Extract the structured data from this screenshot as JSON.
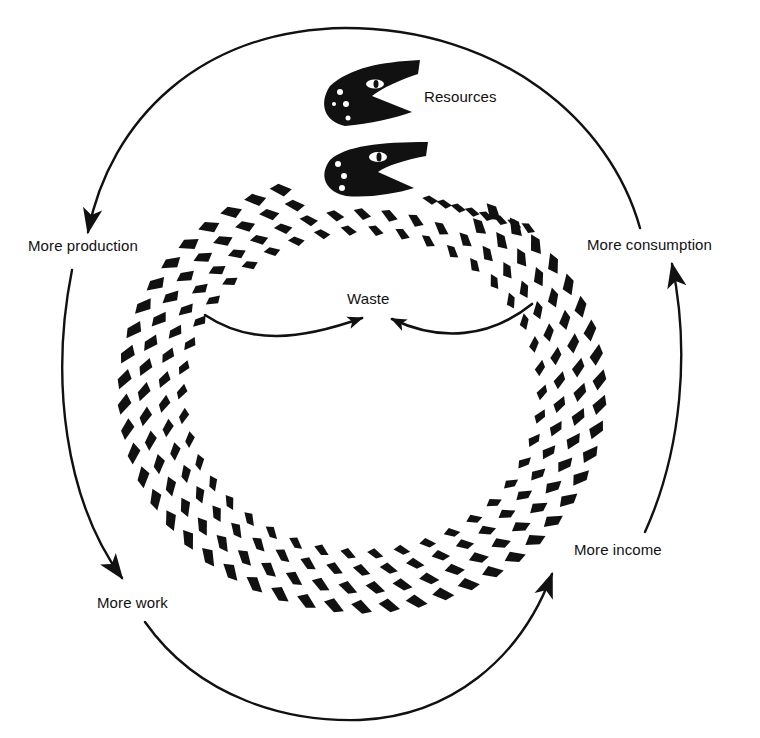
{
  "diagram": {
    "type": "cycle",
    "colors": {
      "ink": "#111111",
      "background": "#ffffff"
    },
    "labels": {
      "resources": "Resources",
      "more_production": "More production",
      "more_consumption": "More consumption",
      "waste": "Waste",
      "more_work": "More work",
      "more_income": "More income"
    },
    "cycle_order": [
      "Resources",
      "More production",
      "More work",
      "More income",
      "More consumption"
    ],
    "flows": [
      {
        "from": "Resources",
        "to": "More production",
        "arrow": "outer-top-arc"
      },
      {
        "from": "More production",
        "to": "More work",
        "arrow": "outer-left-arc"
      },
      {
        "from": "More work",
        "to": "More income",
        "arrow": "outer-bottom-arc"
      },
      {
        "from": "More income",
        "to": "More consumption",
        "arrow": "outer-right-arc"
      },
      {
        "from": "More production",
        "to": "Waste",
        "arrow": "inner-left-arc"
      },
      {
        "from": "More consumption",
        "to": "Waste",
        "arrow": "inner-right-arc"
      }
    ]
  }
}
